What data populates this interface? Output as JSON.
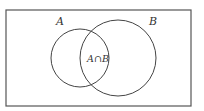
{
  "diagram": {
    "type": "venn",
    "universe": {
      "x": 6,
      "y": 10,
      "width": 185,
      "height": 96
    },
    "sets": [
      {
        "label": "A",
        "cx": 80,
        "cy": 58,
        "r": 29,
        "label_x": 60,
        "label_y": 25
      },
      {
        "label": "B",
        "cx": 118,
        "cy": 58,
        "r": 38,
        "label_x": 153,
        "label_y": 25
      }
    ],
    "intersection": {
      "label": "A∩B",
      "x": 98,
      "y": 62
    },
    "stroke_color": "#444444",
    "background": "#ffffff"
  }
}
